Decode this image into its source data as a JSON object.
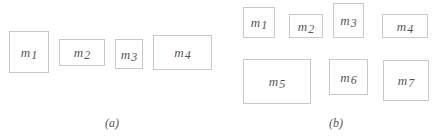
{
  "panels": [
    {
      "caption": "(a)",
      "caption_pos": {
        "x": 112,
        "y": 116
      },
      "boxes": [
        {
          "base": "m",
          "sub": "1",
          "x": 9,
          "y": 31,
          "w": 40,
          "h": 42
        },
        {
          "base": "m",
          "sub": "2",
          "x": 59,
          "y": 39,
          "w": 46,
          "h": 27
        },
        {
          "base": "m",
          "sub": "3",
          "x": 115,
          "y": 39,
          "w": 28,
          "h": 30
        },
        {
          "base": "m",
          "sub": "4",
          "x": 153,
          "y": 35,
          "w": 59,
          "h": 35
        }
      ]
    },
    {
      "caption": "(b)",
      "caption_pos": {
        "x": 336,
        "y": 116
      },
      "boxes": [
        {
          "base": "m",
          "sub": "1",
          "x": 243,
          "y": 7,
          "w": 32,
          "h": 31
        },
        {
          "base": "m",
          "sub": "2",
          "x": 289,
          "y": 14,
          "w": 34,
          "h": 24
        },
        {
          "base": "m",
          "sub": "3",
          "x": 333,
          "y": 3,
          "w": 31,
          "h": 35
        },
        {
          "base": "m",
          "sub": "4",
          "x": 382,
          "y": 14,
          "w": 46,
          "h": 24
        },
        {
          "base": "m",
          "sub": "5",
          "x": 243,
          "y": 59,
          "w": 68,
          "h": 45
        },
        {
          "base": "m",
          "sub": "6",
          "x": 329,
          "y": 59,
          "w": 39,
          "h": 36
        },
        {
          "base": "m",
          "sub": "7",
          "x": 383,
          "y": 60,
          "w": 46,
          "h": 41
        }
      ]
    }
  ],
  "colors": {
    "border": "#c8c8c8",
    "text": "#555555",
    "background": "#ffffff"
  }
}
